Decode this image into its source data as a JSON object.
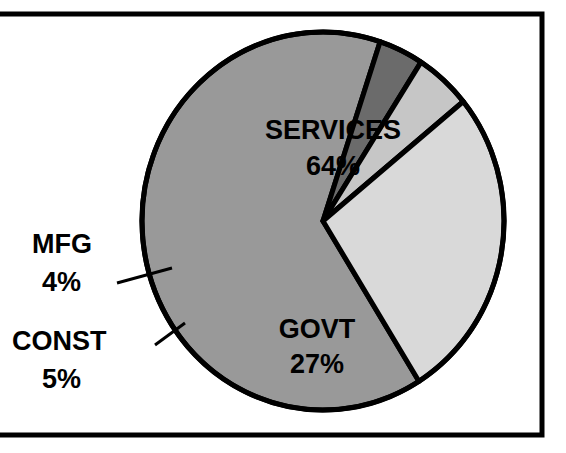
{
  "chart_data": {
    "type": "pie",
    "title": "",
    "subtitle": "",
    "xlabel": "",
    "ylabel": "",
    "legend_position": "none",
    "grid": false,
    "labels_inside": true,
    "categories": [
      "SERVICES",
      "GOVT",
      "CONST",
      "MFG"
    ],
    "values": [
      64,
      27,
      5,
      4
    ],
    "units": "%",
    "slices": [
      {
        "name": "SERVICES",
        "label": "SERVICES",
        "value": 64,
        "value_text": "64%",
        "color": "#999999",
        "label_placement": "inside"
      },
      {
        "name": "GOVT",
        "label": "GOVT",
        "value": 27,
        "value_text": "27%",
        "color": "#d9d9d9",
        "label_placement": "inside"
      },
      {
        "name": "CONST",
        "label": "CONST",
        "value": 5,
        "value_text": "5%",
        "color": "#c6c6c6",
        "label_placement": "callout-left"
      },
      {
        "name": "MFG",
        "label": "MFG",
        "value": 4,
        "value_text": "4%",
        "color": "#6b6b6b",
        "label_placement": "callout-left"
      }
    ]
  },
  "frame": {
    "border_color": "#000000",
    "background": "#ffffff"
  },
  "style": {
    "slice_outline_color": "#000000",
    "text_color": "#000000"
  }
}
